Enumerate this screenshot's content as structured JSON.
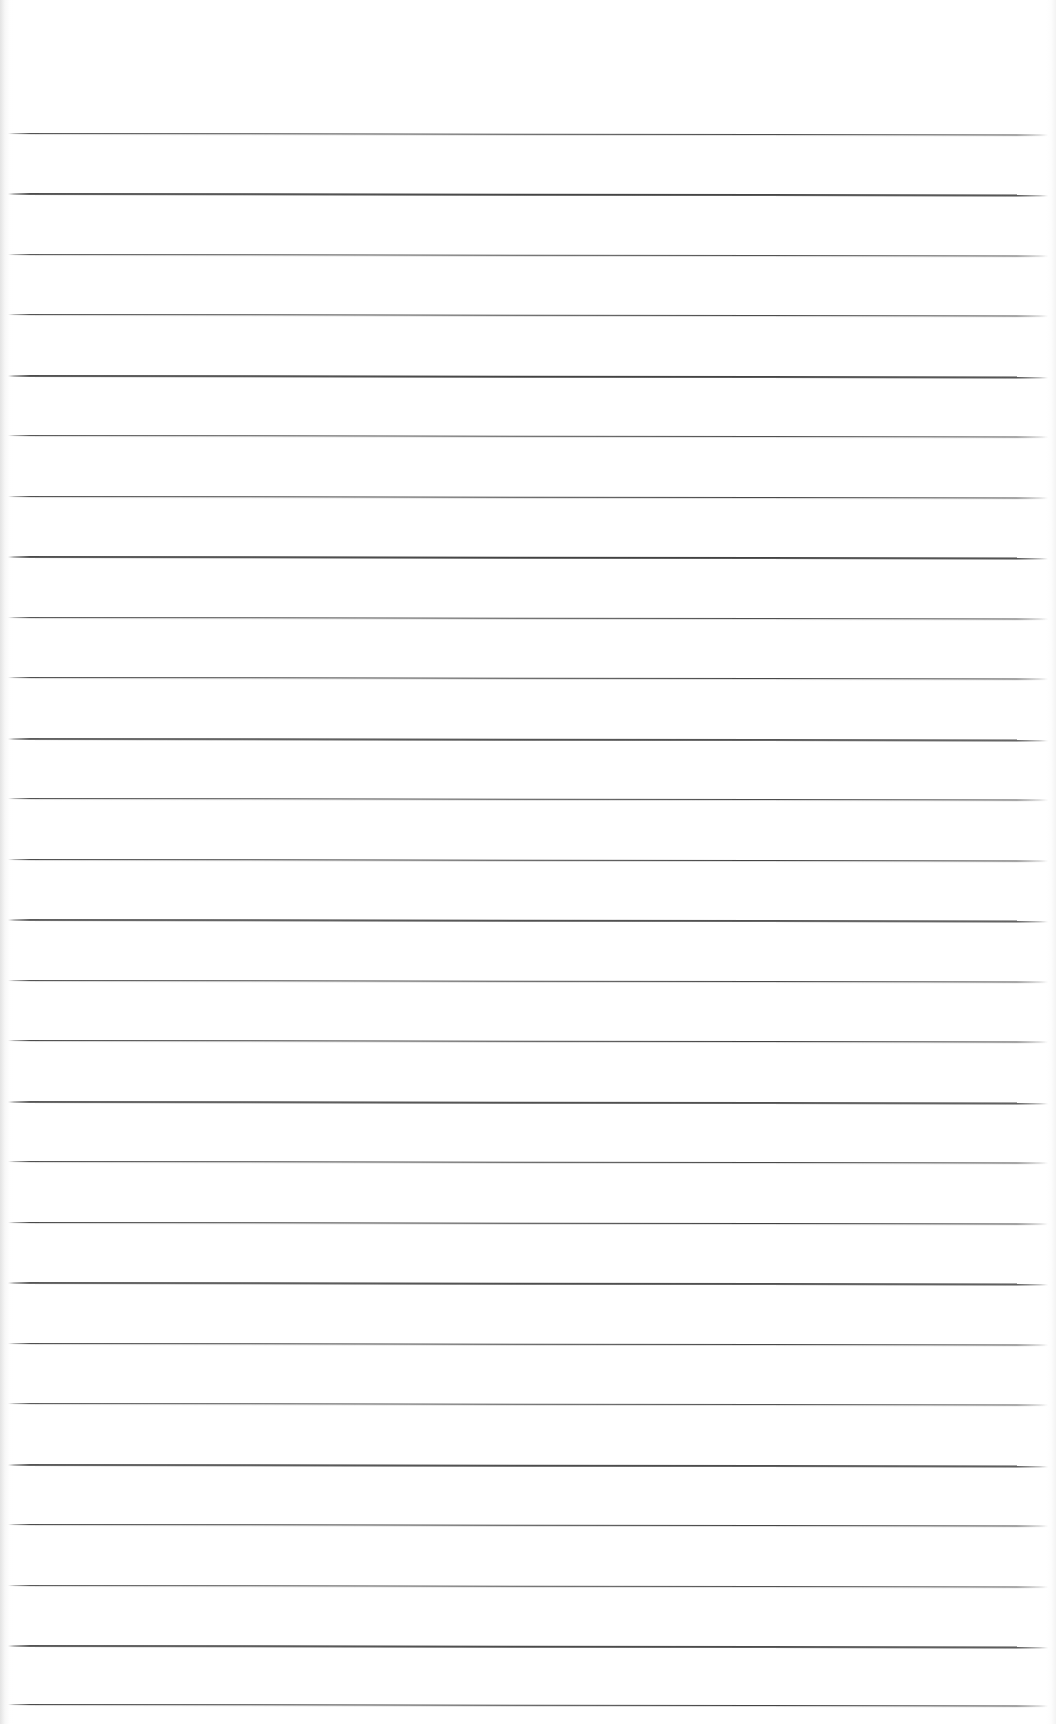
{
  "document": {
    "kind": "ruled-notebook-page",
    "title": "",
    "body_text": "",
    "page_background_color": "#ffffff",
    "rule_color": "#3a3a3a",
    "page_width_px": 1056,
    "page_height_px": 1724,
    "top_margin_px": 133,
    "left_rule_start_px": 8,
    "right_rule_end_px": 1048,
    "rule_spacing_px": 60.4,
    "rule_slope_deg": 0.08,
    "rule_count": 27,
    "rules": [
      {
        "index": 1,
        "y": 133,
        "content": ""
      },
      {
        "index": 2,
        "y": 193,
        "content": ""
      },
      {
        "index": 3,
        "y": 254,
        "content": ""
      },
      {
        "index": 4,
        "y": 314,
        "content": ""
      },
      {
        "index": 5,
        "y": 375,
        "content": ""
      },
      {
        "index": 6,
        "y": 435,
        "content": ""
      },
      {
        "index": 7,
        "y": 496,
        "content": ""
      },
      {
        "index": 8,
        "y": 556,
        "content": ""
      },
      {
        "index": 9,
        "y": 617,
        "content": ""
      },
      {
        "index": 10,
        "y": 677,
        "content": ""
      },
      {
        "index": 11,
        "y": 738,
        "content": ""
      },
      {
        "index": 12,
        "y": 798,
        "content": ""
      },
      {
        "index": 13,
        "y": 859,
        "content": ""
      },
      {
        "index": 14,
        "y": 919,
        "content": ""
      },
      {
        "index": 15,
        "y": 980,
        "content": ""
      },
      {
        "index": 16,
        "y": 1040,
        "content": ""
      },
      {
        "index": 17,
        "y": 1101,
        "content": ""
      },
      {
        "index": 18,
        "y": 1161,
        "content": ""
      },
      {
        "index": 19,
        "y": 1222,
        "content": ""
      },
      {
        "index": 20,
        "y": 1282,
        "content": ""
      },
      {
        "index": 21,
        "y": 1343,
        "content": ""
      },
      {
        "index": 22,
        "y": 1403,
        "content": ""
      },
      {
        "index": 23,
        "y": 1464,
        "content": ""
      },
      {
        "index": 24,
        "y": 1524,
        "content": ""
      },
      {
        "index": 25,
        "y": 1585,
        "content": ""
      },
      {
        "index": 26,
        "y": 1645,
        "content": ""
      },
      {
        "index": 27,
        "y": 1704,
        "content": ""
      }
    ]
  }
}
